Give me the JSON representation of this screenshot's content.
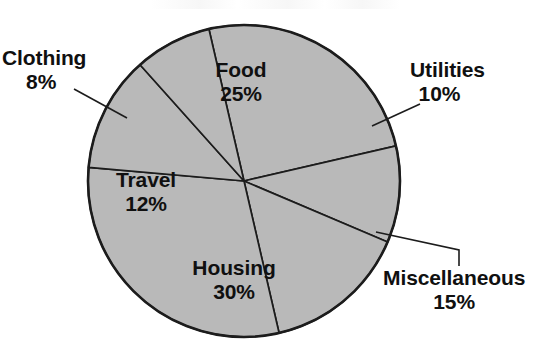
{
  "chart_data": {
    "type": "pie",
    "title": "",
    "xlabel": "",
    "ylabel": "",
    "categories": [
      "Food",
      "Utilities",
      "Miscellaneous",
      "Housing",
      "Travel",
      "Clothing"
    ],
    "values": [
      25,
      10,
      15,
      30,
      12,
      8
    ],
    "unit": "%",
    "total": 100,
    "legend": "none",
    "grid": false,
    "slice_fill_color": "#b9b9b9",
    "slice_border_color": "#1c1c1c",
    "background_color": "#ffffff",
    "label_placement": {
      "Food": "inside",
      "Housing": "inside",
      "Travel": "inside",
      "Clothing": "outside-left-with-leader",
      "Utilities": "outside-right-with-leader",
      "Miscellaneous": "outside-right-with-leader"
    },
    "slices": [
      {
        "label": "Food",
        "value": 25,
        "percent_text": "25%",
        "start_angle_deg": -103.0,
        "end_angle_deg": -13.0
      },
      {
        "label": "Utilities",
        "value": 10,
        "percent_text": "10%",
        "start_angle_deg": -13.0,
        "end_angle_deg": 23.0
      },
      {
        "label": "Miscellaneous",
        "value": 15,
        "percent_text": "15%",
        "start_angle_deg": 23.0,
        "end_angle_deg": 77.0
      },
      {
        "label": "Housing",
        "value": 30,
        "percent_text": "30%",
        "start_angle_deg": 77.0,
        "end_angle_deg": 185.0
      },
      {
        "label": "Travel",
        "value": 12,
        "percent_text": "12%",
        "start_angle_deg": 185.0,
        "end_angle_deg": 228.2
      },
      {
        "label": "Clothing",
        "value": 8,
        "percent_text": "8%",
        "start_angle_deg": 228.2,
        "end_angle_deg": 257.0
      }
    ]
  },
  "labels": {
    "clothing": {
      "name": "Clothing",
      "pct": "8%"
    },
    "food": {
      "name": "Food",
      "pct": "25%"
    },
    "utilities": {
      "name": "Utilities",
      "pct": "10%"
    },
    "travel": {
      "name": "Travel",
      "pct": "12%"
    },
    "housing": {
      "name": "Housing",
      "pct": "30%"
    },
    "miscellaneous": {
      "name": "Miscellaneous",
      "pct": "15%"
    }
  }
}
